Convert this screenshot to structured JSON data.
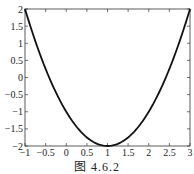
{
  "chart_data": {
    "type": "line",
    "title": "",
    "xlabel": "",
    "ylabel": "",
    "xlim": [
      -1,
      3
    ],
    "ylim": [
      -2,
      2
    ],
    "xticks": [
      "-1",
      "-0.5",
      "0",
      "0.5",
      "1",
      "1.5",
      "2",
      "2.5",
      "3"
    ],
    "yticks": [
      "2",
      "1.5",
      "1",
      "0.5",
      "0",
      "-0.5",
      "-1",
      "-1.5",
      "-2"
    ],
    "grid": false,
    "series": [
      {
        "name": "y=(x-1)^2-2",
        "color": "#111111",
        "x": [
          -1,
          -0.5,
          0,
          0.5,
          1,
          1.5,
          2,
          2.5,
          3
        ],
        "values": [
          2,
          0.25,
          -1,
          -1.75,
          -2,
          -1.75,
          -1,
          0.25,
          2
        ]
      }
    ]
  },
  "caption": "图 4.6.2"
}
